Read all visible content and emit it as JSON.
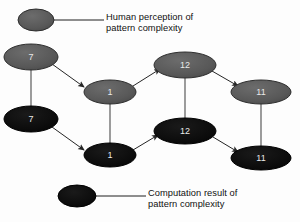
{
  "figure": {
    "type": "diagram",
    "background_color": "#fdfdfd"
  },
  "colors": {
    "human_node": "#5a5a5a",
    "human_node_stroke": "#2e2e2e",
    "computation_node": "#0d0d0d",
    "computation_node_stroke": "#000000",
    "edge": "#3a3a3a",
    "label_text": "#e9e9e9",
    "legend_text": "#101010"
  },
  "legend": {
    "items": [
      {
        "key": "human",
        "swatch_name": "gray-ellipse-swatch",
        "line1": "Human perception of",
        "line2": "pattern complexity"
      },
      {
        "key": "computation",
        "swatch_name": "black-ellipse-swatch",
        "line1": "Computation result of",
        "line2": "pattern complexity"
      }
    ]
  },
  "graph": {
    "rows": [
      {
        "key": "human",
        "label": "Human perception of pattern complexity"
      },
      {
        "key": "computation",
        "label": "Computation result of pattern complexity"
      }
    ],
    "nodes": [
      {
        "id": "h7",
        "row": "human",
        "value": "7",
        "cx": 31,
        "cy": 57,
        "rx": 27,
        "ry": 13
      },
      {
        "id": "c7",
        "row": "computation",
        "value": "7",
        "cx": 31,
        "cy": 119,
        "rx": 27,
        "ry": 13
      },
      {
        "id": "h1",
        "row": "human",
        "value": "1",
        "cx": 110,
        "cy": 92,
        "rx": 26,
        "ry": 12
      },
      {
        "id": "c1",
        "row": "computation",
        "value": "1",
        "cx": 110,
        "cy": 155,
        "rx": 26,
        "ry": 12
      },
      {
        "id": "h12",
        "row": "human",
        "value": "12",
        "cx": 185,
        "cy": 65,
        "rx": 31,
        "ry": 13
      },
      {
        "id": "c12",
        "row": "computation",
        "value": "12",
        "cx": 185,
        "cy": 131,
        "rx": 31,
        "ry": 13
      },
      {
        "id": "h11",
        "row": "human",
        "value": "11",
        "cx": 261,
        "cy": 92,
        "rx": 30,
        "ry": 12
      },
      {
        "id": "c11",
        "row": "computation",
        "value": "11",
        "cx": 261,
        "cy": 158,
        "rx": 30,
        "ry": 12
      }
    ],
    "vertical_links": [
      {
        "from": "h7",
        "to": "c7"
      },
      {
        "from": "h1",
        "to": "c1"
      },
      {
        "from": "h12",
        "to": "c12"
      },
      {
        "from": "h11",
        "to": "c11"
      }
    ],
    "arrows": [
      {
        "from": "h7",
        "to": "h1"
      },
      {
        "from": "c7",
        "to": "c1"
      },
      {
        "from": "h1",
        "to": "h12"
      },
      {
        "from": "c1",
        "to": "c12"
      },
      {
        "from": "h12",
        "to": "h11"
      },
      {
        "from": "c12",
        "to": "c11"
      }
    ]
  }
}
